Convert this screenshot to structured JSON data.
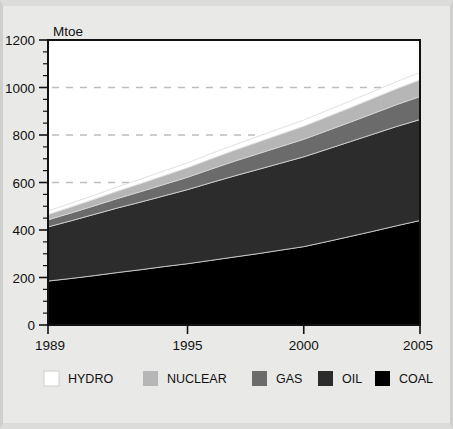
{
  "chart_data": {
    "type": "area",
    "stacked": true,
    "title": "",
    "subtitle": "",
    "xlabel": "",
    "ylabel": "Mtoe",
    "unit": "Mtoe",
    "xlim": [
      1989,
      2005
    ],
    "ylim": [
      0,
      1200
    ],
    "y_ticks": [
      0,
      200,
      400,
      600,
      800,
      1000,
      1200
    ],
    "y_minor_tick_step": 50,
    "x_ticks": [
      1989,
      1995,
      2000,
      2005
    ],
    "x_tick_labels": [
      "1989",
      "1995",
      "2000",
      "2005"
    ],
    "grid": "dashed-horizontal",
    "grid_levels": [
      600,
      800,
      1000
    ],
    "legend_position": "bottom",
    "x": [
      1989,
      1990,
      1991,
      1992,
      1993,
      1994,
      1995,
      1996,
      1997,
      1998,
      1999,
      2000,
      2001,
      2002,
      2003,
      2004,
      2005
    ],
    "series": [
      {
        "name": "COAL",
        "color": "#000000",
        "values": [
          185,
          196,
          208,
          221,
          233,
          246,
          258,
          272,
          286,
          300,
          315,
          330,
          351,
          373,
          395,
          418,
          440
        ]
      },
      {
        "name": "OIL",
        "color": "#2c2c2c",
        "values": [
          228,
          243,
          258,
          272,
          285,
          298,
          312,
          327,
          341,
          354,
          366,
          378,
          389,
          399,
          409,
          418,
          425
        ]
      },
      {
        "name": "GAS",
        "color": "#6b6b6b",
        "values": [
          30,
          33,
          36,
          40,
          44,
          48,
          52,
          57,
          62,
          66,
          70,
          74,
          78,
          82,
          87,
          92,
          97
        ]
      },
      {
        "name": "NUCLEAR",
        "color": "#b6b6b6",
        "values": [
          22,
          25,
          28,
          31,
          34,
          37,
          40,
          43,
          46,
          49,
          52,
          55,
          58,
          61,
          64,
          67,
          70
        ]
      },
      {
        "name": "HYDRO",
        "color": "#ffffff",
        "values": [
          15,
          16,
          17,
          18,
          19,
          20,
          21,
          22,
          23,
          24,
          25,
          26,
          27,
          28,
          29,
          30,
          31
        ]
      }
    ],
    "totals": [
      480,
      513,
      547,
      582,
      615,
      649,
      683,
      721,
      758,
      793,
      828,
      863,
      903,
      943,
      984,
      1025,
      1063
    ],
    "legend": [
      {
        "label": "HYDRO",
        "color": "#ffffff"
      },
      {
        "label": "NUCLEAR",
        "color": "#b6b6b6"
      },
      {
        "label": "GAS",
        "color": "#6b6b6b"
      },
      {
        "label": "OIL",
        "color": "#2c2c2c"
      },
      {
        "label": "COAL",
        "color": "#000000"
      }
    ]
  },
  "colors": {
    "background": "#e9e9e7",
    "axis": "#111111",
    "grid": "#bdbdbd",
    "text": "#111111"
  }
}
